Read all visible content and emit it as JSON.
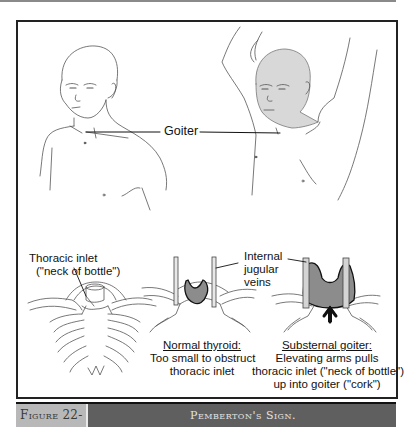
{
  "figure": {
    "number": "Figure 22-3",
    "title": "Pemberton's Sign."
  },
  "labels": {
    "goiter": "Goiter",
    "thoracic_inlet_line1": "Thoracic inlet",
    "thoracic_inlet_line2": "(\"neck of bottle\")",
    "veins_line1": "Internal",
    "veins_line2": "jugular",
    "veins_line3": "veins"
  },
  "panels": {
    "normal": {
      "heading": "Normal thyroid:",
      "line1": "Too small to obstruct",
      "line2": "thoracic inlet"
    },
    "substernal": {
      "heading": "Substernal goiter:",
      "line1": "Elevating arms pulls",
      "line2": "thoracic inlet (\"neck of bottle\")",
      "line3": "up into goiter (\"cork\")"
    }
  },
  "colors": {
    "frame": "#222222",
    "goiter_fill": "#8c8c8c",
    "skin_shade": "#d8d8d8",
    "caption_dark": "#5f5f5f",
    "caption_light": "#b8b8b8"
  }
}
